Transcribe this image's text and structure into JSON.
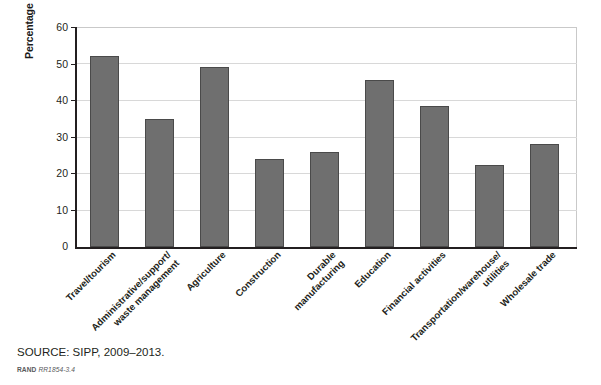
{
  "chart_data": {
    "type": "bar",
    "title": "",
    "subtitle": "",
    "xlabel": "",
    "ylabel": "Percentage of entrants in California\nunder age 30",
    "ylim": [
      0,
      60
    ],
    "ytick_values": [
      60,
      50,
      40,
      30,
      20,
      10,
      0
    ],
    "ytick_labels": [
      "60",
      "50",
      "40",
      "30",
      "20",
      "10",
      "0"
    ],
    "grid": true,
    "grid_axis": "y",
    "legend": null,
    "legend_position": "none",
    "categories": [
      "Travel/tourism",
      "Administrative/support/\nwaste management",
      "Agriculture",
      "Construction",
      "Durable\nmanufacturing",
      "Education",
      "Financial activities",
      "Transportation/warehouse/\nutilities",
      "Wholesale trade"
    ],
    "values": [
      52,
      35,
      49,
      24,
      26,
      45.5,
      38.5,
      22.5,
      28
    ],
    "bar_color": "#6f6f6f",
    "bar_edge_color": "#4a4a4a",
    "axis_color": "#231f20",
    "grid_color": "#d8d8d8"
  },
  "footer": {
    "source": "SOURCE: SIPP, 2009–2013.",
    "rand_word": "RAND",
    "rand_number": "RR1854-3.4"
  }
}
